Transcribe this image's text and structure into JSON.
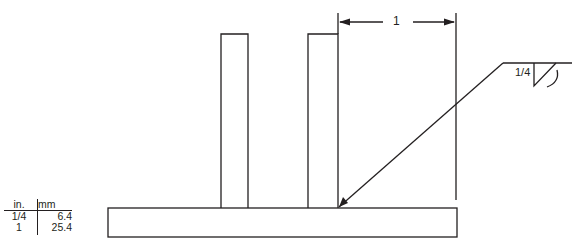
{
  "diagram": {
    "type": "fillet weld detail",
    "dimension_label": "1",
    "weld_size_label": "1/4",
    "stroke_color": "#231f20",
    "background": "#ffffff"
  },
  "conversion_table": {
    "headers": {
      "in": "in.",
      "mm": "mm"
    },
    "rows": [
      {
        "in": "1/4",
        "mm": "6.4"
      },
      {
        "in": "1",
        "mm": "25.4"
      }
    ]
  }
}
